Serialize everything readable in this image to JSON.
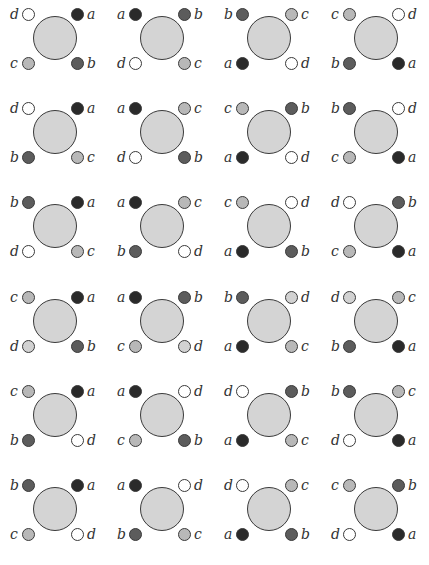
{
  "colors": {
    "a": "#2a2a2a",
    "b": "#5c5c5c",
    "c": "#b8b8b8",
    "d": "#ffffff",
    "d_light": "#d2d2d2",
    "center": "#d4d4d4",
    "outline": "#3a3a3a"
  },
  "grid": {
    "rows": 6,
    "cols": 4,
    "cells": [
      {
        "tl": "d",
        "tr": "a",
        "bl": "c",
        "br": "b"
      },
      {
        "tl": "a",
        "tr": "b",
        "bl": "d",
        "br": "c"
      },
      {
        "tl": "b",
        "tr": "c",
        "bl": "a",
        "br": "d"
      },
      {
        "tl": "c",
        "tr": "d",
        "bl": "b",
        "br": "a"
      },
      {
        "tl": "d",
        "tr": "a",
        "bl": "b",
        "br": "c"
      },
      {
        "tl": "a",
        "tr": "c",
        "bl": "d",
        "br": "b"
      },
      {
        "tl": "c",
        "tr": "b",
        "bl": "a",
        "br": "d"
      },
      {
        "tl": "b",
        "tr": "d",
        "bl": "c",
        "br": "a"
      },
      {
        "tl": "b",
        "tr": "a",
        "bl": "d",
        "br": "c"
      },
      {
        "tl": "a",
        "tr": "c",
        "bl": "b",
        "br": "d"
      },
      {
        "tl": "c",
        "tr": "d",
        "bl": "a",
        "br": "b"
      },
      {
        "tl": "d",
        "tr": "b",
        "bl": "c",
        "br": "a"
      },
      {
        "tl": "c",
        "tr": "a",
        "bl": "d",
        "br": "b",
        "d_fill": "light"
      },
      {
        "tl": "a",
        "tr": "b",
        "bl": "c",
        "br": "d",
        "d_fill": "light"
      },
      {
        "tl": "b",
        "tr": "d",
        "bl": "a",
        "br": "c",
        "d_fill": "light"
      },
      {
        "tl": "d",
        "tr": "c",
        "bl": "b",
        "br": "a",
        "d_fill": "light"
      },
      {
        "tl": "c",
        "tr": "a",
        "bl": "b",
        "br": "d"
      },
      {
        "tl": "a",
        "tr": "d",
        "bl": "c",
        "br": "b"
      },
      {
        "tl": "d",
        "tr": "b",
        "bl": "a",
        "br": "c"
      },
      {
        "tl": "b",
        "tr": "c",
        "bl": "d",
        "br": "a"
      },
      {
        "tl": "b",
        "tr": "a",
        "bl": "c",
        "br": "d"
      },
      {
        "tl": "a",
        "tr": "d",
        "bl": "b",
        "br": "c"
      },
      {
        "tl": "d",
        "tr": "c",
        "bl": "a",
        "br": "b"
      },
      {
        "tl": "c",
        "tr": "b",
        "bl": "d",
        "br": "a"
      }
    ]
  }
}
